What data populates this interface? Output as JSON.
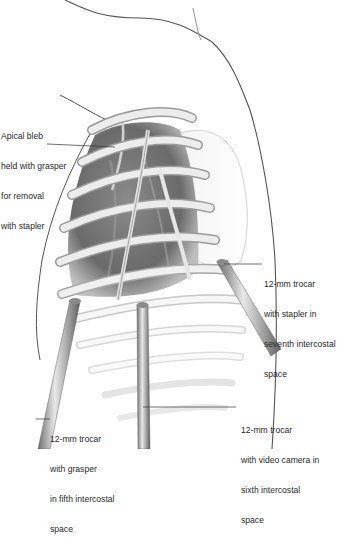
{
  "figure": {
    "colors": {
      "outline": "#555555",
      "rib": "#e6e6e6",
      "rib_shadow": "#9a9a9a",
      "cavity": "#6e6e6e",
      "trocar": "#8c8c8c",
      "label_text": "#2a2a2a",
      "leader": "#333333"
    }
  },
  "labels": {
    "apical_bleb": [
      "Apical bleb",
      "held with grasper",
      "for removal",
      "with stapler"
    ],
    "trocar_stapler": [
      "12-mm trocar",
      "with stapler in",
      "seventh intercostal",
      "space"
    ],
    "trocar_grasper": [
      "12-mm trocar",
      "with grasper",
      "in fifth intercostal",
      "space"
    ],
    "trocar_camera": [
      "12-mm trocar",
      "with video camera in",
      "sixth intercostal",
      "space"
    ]
  }
}
